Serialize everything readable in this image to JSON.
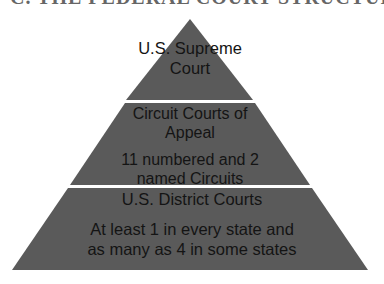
{
  "header": {
    "title": "C. THE FEDERAL COURT STRUCTURE"
  },
  "pyramid": {
    "fill_color": "#5a5a5a",
    "divider_color": "#ffffff",
    "text_color": "#141414",
    "tiers": [
      {
        "name": "supreme-court",
        "lines": [
          "U.S. Supreme",
          "Court"
        ]
      },
      {
        "name": "circuit-courts",
        "lines": [
          "Circuit Courts of",
          "Appeal"
        ],
        "sub_lines": [
          "11 numbered and 2",
          "named Circuits"
        ]
      },
      {
        "name": "district-courts",
        "lines": [
          "U.S. District Courts"
        ],
        "sub_lines": [
          "At least 1 in every state and",
          "as many as 4 in some states"
        ]
      }
    ]
  }
}
